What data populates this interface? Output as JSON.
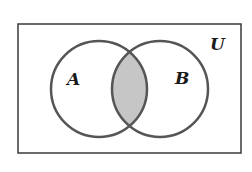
{
  "diagram": {
    "type": "venn",
    "universe_label": "U",
    "sets": [
      {
        "label": "A"
      },
      {
        "label": "B"
      }
    ],
    "shaded_region": "A ∩ B",
    "colors": {
      "stroke": "#555555",
      "shade": "#c6c6c6",
      "background": "#ffffff"
    }
  }
}
